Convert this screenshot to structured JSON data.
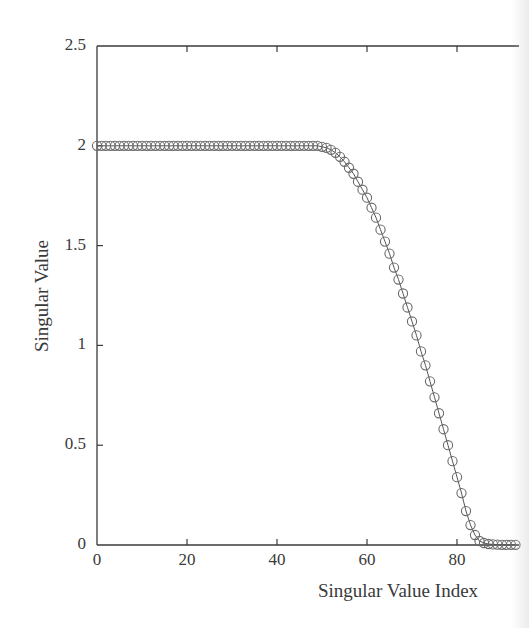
{
  "chart_data": {
    "type": "scatter",
    "title": "",
    "xlabel": "Singular Value Index",
    "ylabel": "Singular Value",
    "xlim": [
      0,
      93
    ],
    "ylim": [
      0,
      2.5
    ],
    "grid": false,
    "legend": null,
    "marker": "circle",
    "connected_line": true,
    "x_ticks": [
      "0",
      "20",
      "40",
      "60",
      "80"
    ],
    "y_ticks": [
      "0",
      "0.5",
      "1",
      "1.5",
      "2",
      "2.5"
    ],
    "series": [
      {
        "name": "singular values",
        "x": [
          0,
          1,
          2,
          3,
          4,
          5,
          6,
          7,
          8,
          9,
          10,
          11,
          12,
          13,
          14,
          15,
          16,
          17,
          18,
          19,
          20,
          21,
          22,
          23,
          24,
          25,
          26,
          27,
          28,
          29,
          30,
          31,
          32,
          33,
          34,
          35,
          36,
          37,
          38,
          39,
          40,
          41,
          42,
          43,
          44,
          45,
          46,
          47,
          48,
          49,
          50,
          51,
          52,
          53,
          54,
          55,
          56,
          57,
          58,
          59,
          60,
          61,
          62,
          63,
          64,
          65,
          66,
          67,
          68,
          69,
          70,
          71,
          72,
          73,
          74,
          75,
          76,
          77,
          78,
          79,
          80,
          81,
          82,
          83,
          84,
          85,
          86,
          87,
          88,
          89,
          90,
          91,
          92,
          93
        ],
        "values": [
          2,
          2,
          2,
          2,
          2,
          2,
          2,
          2,
          2,
          2,
          2,
          2,
          2,
          2,
          2,
          2,
          2,
          2,
          2,
          2,
          2,
          2,
          2,
          2,
          2,
          2,
          2,
          2,
          2,
          2,
          2,
          2,
          2,
          2,
          2,
          2,
          2,
          2,
          2,
          2,
          2,
          2,
          2,
          2,
          2,
          2,
          2,
          2,
          2,
          2,
          1.995,
          1.99,
          1.98,
          1.965,
          1.945,
          1.92,
          1.89,
          1.86,
          1.82,
          1.78,
          1.74,
          1.69,
          1.64,
          1.58,
          1.52,
          1.46,
          1.39,
          1.33,
          1.26,
          1.19,
          1.12,
          1.05,
          0.97,
          0.9,
          0.82,
          0.74,
          0.66,
          0.58,
          0.5,
          0.42,
          0.34,
          0.26,
          0.17,
          0.1,
          0.05,
          0.02,
          0.01,
          0.005,
          0.003,
          0.002,
          0.001,
          0.001,
          0.001,
          0.001
        ]
      }
    ]
  },
  "axes": {
    "x_ticks": [
      {
        "label": "0",
        "v": 0
      },
      {
        "label": "20",
        "v": 20
      },
      {
        "label": "40",
        "v": 40
      },
      {
        "label": "60",
        "v": 60
      },
      {
        "label": "80",
        "v": 80
      }
    ],
    "y_ticks": [
      {
        "label": "0",
        "v": 0
      },
      {
        "label": "0.5",
        "v": 0.5
      },
      {
        "label": "1",
        "v": 1
      },
      {
        "label": "1.5",
        "v": 1.5
      },
      {
        "label": "2",
        "v": 2
      },
      {
        "label": "2.5",
        "v": 2.5
      }
    ],
    "xlabel": "Singular Value Index",
    "ylabel": "Singular Value"
  },
  "colors": {
    "axis": "#3a3a3a",
    "marker": "#6a6a6a",
    "line": "#555555"
  }
}
